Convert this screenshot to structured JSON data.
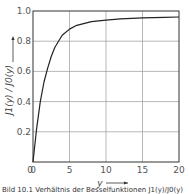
{
  "chart_data": {
    "type": "line",
    "title": "",
    "xlabel": "y",
    "ylabel": "J1(y) / J0(y)",
    "xlim": [
      0,
      20
    ],
    "ylim": [
      0,
      1.0
    ],
    "x_ticks": [
      "0",
      "5",
      "10",
      "15",
      "20"
    ],
    "y_ticks": [
      "0.2",
      "0.4",
      "0.6",
      "0.8",
      "1.0"
    ],
    "grid": true,
    "legend": null,
    "series": [
      {
        "name": "J1(y)/J0(y)",
        "x": [
          0,
          0.5,
          1,
          1.5,
          2,
          2.5,
          3,
          4,
          5,
          6,
          8,
          10,
          12,
          15,
          18,
          20
        ],
        "values": [
          0,
          0.22,
          0.4,
          0.53,
          0.62,
          0.7,
          0.76,
          0.84,
          0.88,
          0.905,
          0.93,
          0.94,
          0.948,
          0.955,
          0.958,
          0.96
        ]
      }
    ]
  },
  "labels": {
    "ylabel_main": "J",
    "ylabel_full": "J1(y) / J0(y)",
    "xlabel": "y",
    "caption": "Bild 10.1 Verhältnis der Besselfunktionen J1(y)/J0(y)"
  }
}
